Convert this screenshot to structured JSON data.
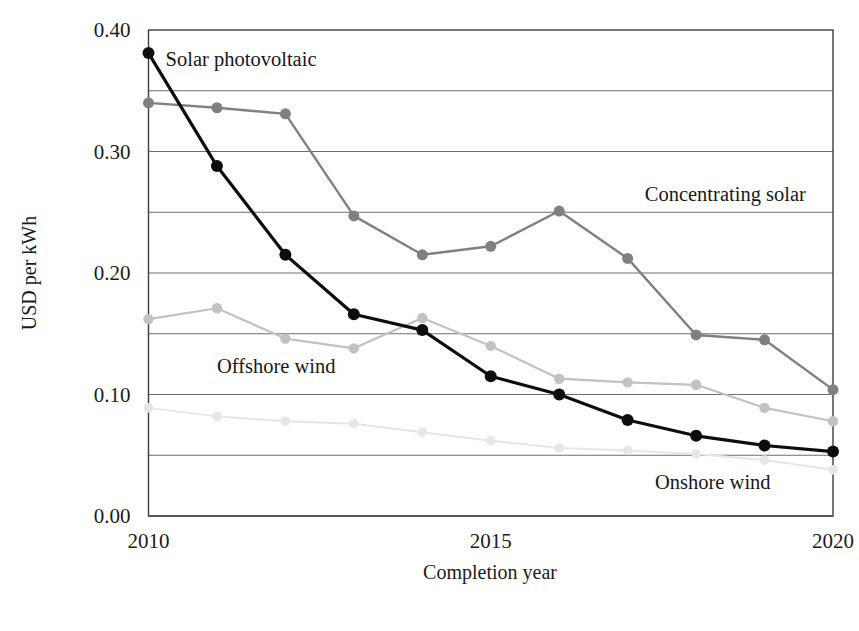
{
  "chart_data": {
    "type": "line",
    "title": "",
    "subtitle": "",
    "xlabel": "Completion year",
    "ylabel": "USD per kWh",
    "x": [
      2010,
      2011,
      2012,
      2013,
      2014,
      2015,
      2016,
      2017,
      2018,
      2019,
      2020
    ],
    "xlim": [
      2010,
      2020
    ],
    "ylim": [
      0.0,
      0.4
    ],
    "xticks": [
      2010,
      2015,
      2020
    ],
    "xtick_labels": [
      "2010",
      "2015",
      "2020"
    ],
    "yticks": [
      0.0,
      0.1,
      0.2,
      0.3,
      0.4
    ],
    "ytick_labels": [
      "0.00",
      "0.10",
      "0.20",
      "0.30",
      "0.40"
    ],
    "gridlines_y": [
      0.0,
      0.05,
      0.1,
      0.15,
      0.2,
      0.25,
      0.3,
      0.35,
      0.4
    ],
    "grid": true,
    "legend_position": "inline-annotations",
    "series": [
      {
        "name": "Solar photovoltaic",
        "color": "#0d0d0d",
        "line_width": 3.2,
        "marker": "circle",
        "marker_size": 6.0,
        "label_x": 2010.25,
        "label_y": 0.375,
        "values": [
          0.381,
          0.288,
          0.215,
          0.166,
          0.153,
          0.115,
          0.1,
          0.079,
          0.066,
          0.058,
          0.053
        ]
      },
      {
        "name": "Concentrating solar",
        "color": "#808080",
        "line_width": 2.4,
        "marker": "circle",
        "marker_size": 5.5,
        "label_x": 2017.25,
        "label_y": 0.264,
        "values": [
          0.34,
          0.336,
          0.331,
          0.247,
          0.215,
          0.222,
          0.251,
          0.212,
          0.149,
          0.145,
          0.104
        ]
      },
      {
        "name": "Offshore wind",
        "color": "#c2c2c2",
        "line_width": 2.2,
        "marker": "circle",
        "marker_size": 5.2,
        "label_x": 2011.0,
        "label_y": 0.123,
        "values": [
          0.162,
          0.171,
          0.146,
          0.138,
          0.163,
          0.14,
          0.113,
          0.11,
          0.108,
          0.089,
          0.078
        ]
      },
      {
        "name": "Onshore wind",
        "color": "#e6e6e6",
        "line_width": 2.0,
        "marker": "circle",
        "marker_size": 4.8,
        "label_x": 2017.4,
        "label_y": 0.027,
        "values": [
          0.089,
          0.082,
          0.078,
          0.076,
          0.069,
          0.062,
          0.056,
          0.054,
          0.051,
          0.046,
          0.038
        ]
      }
    ]
  },
  "axes": {
    "x_title": "Completion year",
    "y_title": "USD per kWh"
  },
  "colors": {
    "frame": "#3d3d3d",
    "gridline": "#6e6e6e",
    "background": "#ffffff",
    "text": "#1b1b1b"
  }
}
